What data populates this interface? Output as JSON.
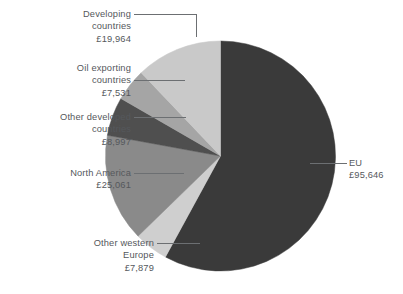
{
  "chart_data": {
    "type": "pie",
    "title": "",
    "subtitle": "",
    "xlabel": "",
    "ylabel": "",
    "currency": "£",
    "total": 165078,
    "categories": [
      "EU",
      "Other western Europe",
      "North America",
      "Other developed countries",
      "Oil exporting countries",
      "Developing countries"
    ],
    "values": [
      95646,
      7879,
      25061,
      8997,
      7531,
      19964
    ],
    "value_labels": [
      "£95,646",
      "£7,879",
      "£25,061",
      "£8,997",
      "£7,531",
      "£19,964"
    ],
    "colors": [
      "#3a3a3a",
      "#cfcfcf",
      "#8a8a8a",
      "#4f4f4f",
      "#a5a5a5",
      "#c9c9c9"
    ],
    "legend_position": "callout-labels",
    "grid": false,
    "slices": [
      {
        "name": "EU",
        "label_line1": "EU",
        "label_line2": "£95,646",
        "value": 95646,
        "percent": 57.9,
        "start_angle": 0.0,
        "end_angle": 208.6,
        "color": "#3a3a3a"
      },
      {
        "name": "Other western Europe",
        "label_line1": "Other western",
        "label_line2": "Europe",
        "label_line3": "£7,879",
        "value": 7879,
        "percent": 4.8,
        "start_angle": 208.6,
        "end_angle": 225.8,
        "color": "#cfcfcf"
      },
      {
        "name": "North America",
        "label_line1": "North America",
        "label_line2": "£25,061",
        "value": 25061,
        "percent": 15.2,
        "start_angle": 225.8,
        "end_angle": 280.4,
        "color": "#8a8a8a"
      },
      {
        "name": "Other developed countries",
        "label_line1": "Other developed",
        "label_line2": "countries",
        "label_line3": "£8,997",
        "value": 8997,
        "percent": 5.4,
        "start_angle": 280.4,
        "end_angle": 300.0,
        "color": "#4f4f4f"
      },
      {
        "name": "Oil exporting countries",
        "label_line1": "Oil exporting",
        "label_line2": "countries",
        "label_line3": "£7,531",
        "value": 7531,
        "percent": 4.6,
        "start_angle": 300.0,
        "end_angle": 316.4,
        "color": "#a5a5a5"
      },
      {
        "name": "Developing countries",
        "label_line1": "Developing",
        "label_line2": "countries",
        "label_line3": "£19,964",
        "value": 19964,
        "percent": 12.1,
        "start_angle": 316.4,
        "end_angle": 360.0,
        "color": "#c9c9c9"
      }
    ]
  }
}
